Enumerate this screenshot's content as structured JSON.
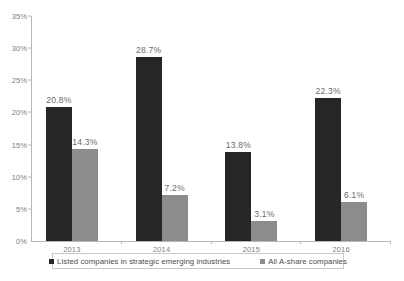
{
  "chart_data": {
    "type": "bar",
    "title": "",
    "subtitle": "",
    "xlabel": "",
    "ylabel": "",
    "categories": [
      "2013",
      "2014",
      "2015",
      "2016"
    ],
    "series": [
      {
        "name": "Listed companies in strategic emerging industries",
        "color": "#262626",
        "values": [
          20.8,
          28.7,
          13.8,
          22.3
        ],
        "labels": [
          "20.8%",
          "28.7%",
          "13.8%",
          "22.3%"
        ]
      },
      {
        "name": "All A-share companies",
        "color": "#8c8c8c",
        "values": [
          14.3,
          7.2,
          3.1,
          6.1
        ],
        "labels": [
          "14.3%",
          "7.2%",
          "3.1%",
          "6.1%"
        ]
      }
    ],
    "ylim": [
      0,
      35
    ],
    "ytick_values": [
      0,
      5,
      10,
      15,
      20,
      25,
      30,
      35
    ],
    "ytick_labels": [
      "0%",
      "5%",
      "10%",
      "15%",
      "20%",
      "25%",
      "30%",
      "35%"
    ],
    "grid": false,
    "legend_position": "bottom",
    "axis_color": "#b7b7b7",
    "tick_label_color": "#808080",
    "data_label_color": "#6b6b6b"
  },
  "legend": {
    "items": [
      {
        "label": "Listed companies in strategic emerging industries",
        "color": "#262626"
      },
      {
        "label": "All A-share companies",
        "color": "#8c8c8c"
      }
    ]
  }
}
